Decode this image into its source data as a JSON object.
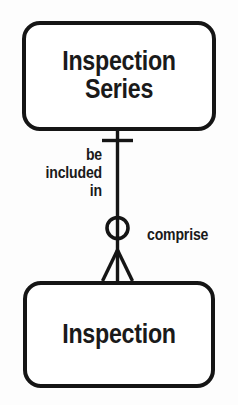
{
  "diagram": {
    "type": "entity-relationship-diagram",
    "notation": "crows-foot",
    "background_color": "#fdfdfd",
    "line_color": "#151515",
    "entities": [
      {
        "id": "inspection-series",
        "label": "Inspection\nSeries",
        "position": "top"
      },
      {
        "id": "inspection",
        "label": "Inspection",
        "position": "bottom"
      }
    ],
    "relationship": {
      "label_left": "be\nincluded\nin",
      "label_right": "comprise",
      "parent_cardinality": "one-and-only-one",
      "child_cardinality": "zero-or-many",
      "parent_symbol": "single-bar",
      "child_symbol": "circle-crows-foot"
    }
  }
}
